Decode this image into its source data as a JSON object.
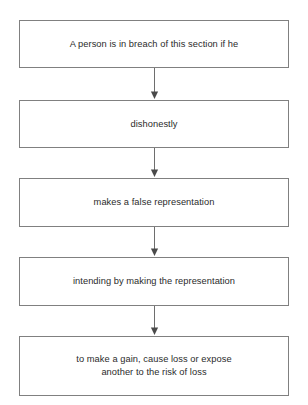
{
  "diagram": {
    "background_color": "#ffffff",
    "box_border_color": "#808080",
    "text_color": "#2b2b2b",
    "arrow_color": "#6e6e6e",
    "nodes": [
      {
        "id": "node-1",
        "label": "A person is in breach of this section if he"
      },
      {
        "id": "node-2",
        "label": "dishonestly"
      },
      {
        "id": "node-3",
        "label": "makes a false representation"
      },
      {
        "id": "node-4",
        "label": "intending by making the representation"
      },
      {
        "id": "node-5",
        "label": "to make a gain, cause loss or expose\nanother to the risk of loss"
      }
    ],
    "connectors": [
      {
        "id": "connector-1",
        "from": "node-1",
        "to": "node-2",
        "direction": "down"
      },
      {
        "id": "connector-2",
        "from": "node-2",
        "to": "node-3",
        "direction": "down"
      },
      {
        "id": "connector-3",
        "from": "node-3",
        "to": "node-4",
        "direction": "down"
      },
      {
        "id": "connector-4",
        "from": "node-4",
        "to": "node-5",
        "direction": "down"
      }
    ]
  }
}
